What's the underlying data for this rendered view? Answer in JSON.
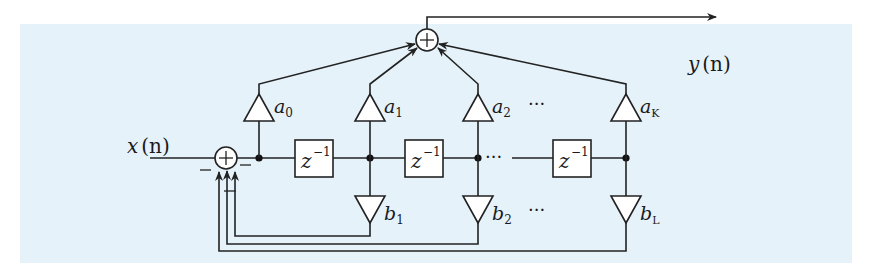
{
  "diagram": {
    "type": "IIR direct-form filter block diagram",
    "background_color": "#e6f2fa",
    "input_label": "x",
    "input_arg": "(n)",
    "output_label": "y",
    "output_arg": "(n)",
    "delay_label": "z",
    "delay_exponent": "−1",
    "ellipsis": "···",
    "feedforward_gains": [
      {
        "base": "a",
        "sub": "0"
      },
      {
        "base": "a",
        "sub": "1"
      },
      {
        "base": "a",
        "sub": "2"
      },
      {
        "base": "a",
        "sub": "K"
      }
    ],
    "feedback_gains": [
      {
        "base": "b",
        "sub": "1"
      },
      {
        "base": "b",
        "sub": "2"
      },
      {
        "base": "b",
        "sub": "L"
      }
    ],
    "input_adder_signs": [
      "−",
      "−",
      "−"
    ]
  }
}
